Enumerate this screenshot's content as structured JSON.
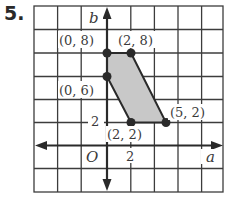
{
  "problem": {
    "number": "5."
  },
  "graph": {
    "x_axis_label": "a",
    "y_axis_label": "b",
    "origin_label": "O",
    "x_tick_label": "2",
    "y_tick_label": "2",
    "units_per_cell": 2,
    "grid": {
      "cols": 8,
      "rows": 8
    },
    "colors": {
      "grid": "#3c3c3c",
      "fill": "#c8c8c8",
      "point": "#2a2a2a"
    },
    "points": [
      {
        "label": "(0, 8)",
        "x": 0,
        "y": 8
      },
      {
        "label": "(2, 8)",
        "x": 2,
        "y": 8
      },
      {
        "label": "(0, 6)",
        "x": 0,
        "y": 6
      },
      {
        "label": "(2, 2)",
        "x": 2,
        "y": 2
      },
      {
        "label": "(5, 2)",
        "x": 5,
        "y": 2
      }
    ],
    "shape": "quadrilateral with vertices (0,8), (2,8), (5,2), (2,2), (0,6)"
  }
}
